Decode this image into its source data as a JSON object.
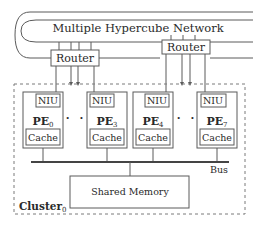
{
  "network": {
    "label": "Multiple Hypercube Network"
  },
  "routers": [
    {
      "label": "Router"
    },
    {
      "label": "Router"
    }
  ],
  "pes": [
    {
      "name": "PE",
      "sub": "0",
      "niu": "NIU",
      "cache": "Cache"
    },
    {
      "name": "PE",
      "sub": "3",
      "niu": "NIU",
      "cache": "Cache"
    },
    {
      "name": "PE",
      "sub": "4",
      "niu": "NIU",
      "cache": "Cache"
    },
    {
      "name": "PE",
      "sub": "7",
      "niu": "NIU",
      "cache": "Cache"
    }
  ],
  "ellipsis": "· ·",
  "bus": {
    "label": "Bus"
  },
  "shared_memory": {
    "label": "Shared Memory"
  },
  "cluster": {
    "name": "Cluster",
    "sub": "0"
  },
  "colors": {
    "line": "#5a5a5a",
    "text": "#2a2a2a",
    "background": "#ffffff"
  }
}
